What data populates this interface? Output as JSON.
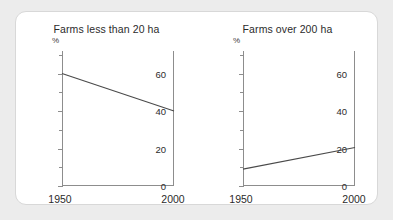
{
  "figure": {
    "background_color": "#ececec",
    "panel_color": "#ffffff",
    "border_color": "#d8d8d8",
    "axis_color": "#8d8d8d",
    "line_color": "#4a4a4a"
  },
  "chart_data": [
    {
      "type": "line",
      "title": "Farms less than 20 ha",
      "xlabel": "",
      "ylabel": "%",
      "x": [
        1950,
        2000
      ],
      "values": [
        60,
        40
      ],
      "xlim": [
        1950,
        2000
      ],
      "ylim": [
        0,
        72
      ],
      "xticks": [
        "1950",
        "2000"
      ],
      "yticks": [
        "0",
        "20",
        "40",
        "60"
      ],
      "ytick_values": [
        0,
        20,
        40,
        60
      ],
      "yminor_values": [
        10,
        30,
        50,
        70
      ],
      "grid": false,
      "legend": "none"
    },
    {
      "type": "line",
      "title": "Farms over 200 ha",
      "xlabel": "",
      "ylabel": "%",
      "x": [
        1950,
        2000
      ],
      "values": [
        9,
        20.5
      ],
      "xlim": [
        1950,
        2000
      ],
      "ylim": [
        0,
        72
      ],
      "xticks": [
        "1950",
        "2000"
      ],
      "yticks": [
        "0",
        "20",
        "40",
        "60"
      ],
      "ytick_values": [
        0,
        20,
        40,
        60
      ],
      "yminor_values": [
        10,
        30,
        50,
        70
      ],
      "grid": false,
      "legend": "none"
    }
  ]
}
